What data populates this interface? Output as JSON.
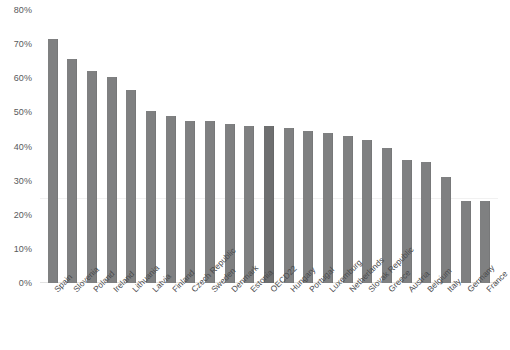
{
  "chart_data": {
    "type": "bar",
    "title": "",
    "subtitle": "",
    "xlabel": "",
    "ylabel": "",
    "ylim": [
      0,
      80
    ],
    "ytick_labels": [
      "80%",
      "70%",
      "60%",
      "50%",
      "40%",
      "30%",
      "20%",
      "10%",
      "0%"
    ],
    "ytick_values": [
      80,
      70,
      60,
      50,
      40,
      30,
      20,
      10,
      0
    ],
    "grid": true,
    "legend": "none",
    "bar_color": "#7f8081",
    "highlight_color": "#6e6f70",
    "highlight_category": "OECD22",
    "categories": [
      "Spain",
      "Slovenia",
      "Poland",
      "Ireland",
      "Lithuania",
      "Latvia",
      "Finland",
      "Czech Republic",
      "Sweden",
      "Denmark",
      "Estonia",
      "OECD22",
      "Hungary",
      "Portugal",
      "Luxemburg",
      "Netherlands",
      "Slovak Republic",
      "Greece",
      "Austria",
      "Belgium",
      "Italy",
      "Germany",
      "France"
    ],
    "values": [
      71.5,
      65.5,
      62.0,
      60.5,
      56.5,
      50.5,
      49.0,
      47.5,
      47.5,
      46.5,
      46.0,
      46.0,
      45.5,
      44.5,
      44.0,
      43.0,
      42.0,
      39.5,
      36.0,
      35.5,
      31.0,
      24.0,
      24.0
    ]
  }
}
